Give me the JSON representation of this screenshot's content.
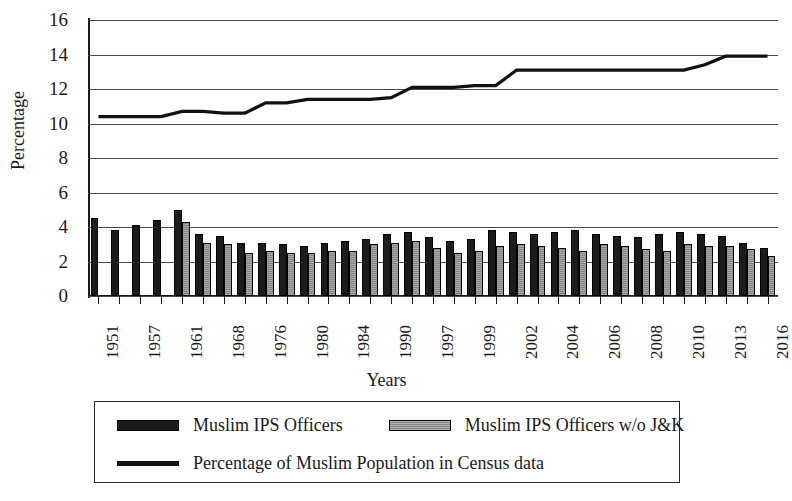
{
  "chart_data": {
    "type": "bar",
    "title": "",
    "xlabel": "Years",
    "ylabel": "Percentage",
    "ylim": [
      0,
      16
    ],
    "ytick_step": 2,
    "yticks": [
      0,
      2,
      4,
      6,
      8,
      10,
      12,
      14,
      16
    ],
    "grid": true,
    "legend_position": "bottom",
    "categories": [
      "1951",
      "1953",
      "1957",
      "1959",
      "1961",
      "1965",
      "1968",
      "1972",
      "1976",
      "1978",
      "1980",
      "1982",
      "1984",
      "1987",
      "1990",
      "1993",
      "1997",
      "1998",
      "1999",
      "2000",
      "2002",
      "2003",
      "2004",
      "2005",
      "2006",
      "2007",
      "2008",
      "2009",
      "2010",
      "2011",
      "2013",
      "2015",
      "2016"
    ],
    "visible_tick_labels": [
      "1951",
      "1957",
      "1961",
      "1968",
      "1976",
      "1980",
      "1984",
      "1990",
      "1997",
      "1999",
      "2002",
      "2004",
      "2006",
      "2008",
      "2010",
      "2013",
      "2016"
    ],
    "series": [
      {
        "name": "Muslim IPS Officers",
        "render": "bar",
        "color": "#1c1c1c",
        "values": [
          4.5,
          3.8,
          4.1,
          4.4,
          5.0,
          3.6,
          3.5,
          3.1,
          3.1,
          3.0,
          2.9,
          3.1,
          3.2,
          3.3,
          3.6,
          3.7,
          3.4,
          3.2,
          3.3,
          3.8,
          3.7,
          3.6,
          3.7,
          3.8,
          3.6,
          3.5,
          3.4,
          3.6,
          3.7,
          3.6,
          3.5,
          3.1,
          2.8
        ]
      },
      {
        "name": "Muslim IPS Officers w/o J&K",
        "render": "bar",
        "color": "#8f8f8f",
        "values": [
          null,
          null,
          null,
          null,
          4.3,
          3.1,
          3.0,
          2.5,
          2.6,
          2.5,
          2.5,
          2.6,
          2.6,
          3.0,
          3.1,
          3.2,
          2.8,
          2.5,
          2.6,
          2.9,
          3.0,
          2.9,
          2.8,
          2.6,
          3.0,
          2.9,
          2.7,
          2.6,
          3.0,
          2.9,
          2.9,
          2.7,
          2.3
        ]
      },
      {
        "name": "Percentage of Muslim Population in Census data",
        "render": "line",
        "color": "#111111",
        "values": [
          10.4,
          10.4,
          10.4,
          10.4,
          10.7,
          10.7,
          10.6,
          10.6,
          11.2,
          11.2,
          11.4,
          11.4,
          11.4,
          11.4,
          11.5,
          12.1,
          12.1,
          12.1,
          12.2,
          12.2,
          13.1,
          13.1,
          13.1,
          13.1,
          13.1,
          13.1,
          13.1,
          13.1,
          13.1,
          13.4,
          13.9,
          13.9,
          13.9
        ]
      }
    ]
  },
  "axes": {
    "y_title": "Percentage",
    "x_title": "Years"
  },
  "legend": {
    "items": [
      {
        "label": "Muslim IPS Officers",
        "swatch": "dark-bar-swatch"
      },
      {
        "label": "Muslim IPS Officers w/o J&K",
        "swatch": "gray-bar-swatch"
      },
      {
        "label": "Percentage of Muslim Population in Census data",
        "swatch": "line-swatch"
      }
    ]
  }
}
